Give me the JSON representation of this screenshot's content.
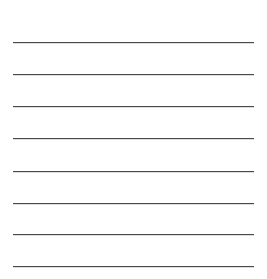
{
  "sheet": {
    "type": "lined-paper",
    "background": "#ffffff",
    "line_color": "#4a4a4a",
    "line_count": 8,
    "line_left": 13,
    "line_width": 241,
    "line_positions_y": [
      42,
      74,
      106,
      138,
      171,
      203,
      234,
      266
    ]
  }
}
